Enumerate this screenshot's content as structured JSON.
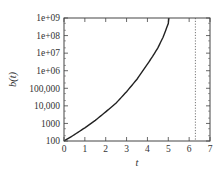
{
  "chart_data": {
    "type": "line",
    "title": "",
    "xlabel": "t",
    "ylabel": "b(t)",
    "xlim": [
      0,
      7
    ],
    "ylim": [
      100,
      1000000000
    ],
    "yscale": "log",
    "grid": false,
    "legend": "none",
    "x_ticks": [
      0,
      1,
      2,
      3,
      4,
      5,
      6,
      7
    ],
    "x_tick_labels": [
      "0",
      "1",
      "2",
      "3",
      "4",
      "5",
      "6",
      "7"
    ],
    "y_ticks": [
      100,
      1000,
      10000,
      100000,
      1000000,
      10000000,
      100000000,
      1000000000
    ],
    "y_tick_labels": [
      "100",
      "1000",
      "10,000",
      "100,000",
      "1e+06",
      "1e+07",
      "1e+08",
      "1e+09"
    ],
    "series": [
      {
        "name": "b(t)",
        "color": "#222222",
        "style": "solid",
        "x": [
          0,
          0.5,
          1,
          1.5,
          2,
          2.5,
          3,
          3.5,
          4,
          4.25,
          4.5,
          4.75,
          5.0,
          5.03
        ],
        "y": [
          100,
          229,
          564,
          1490,
          4550,
          14500,
          64000,
          328000,
          2380000,
          6540000,
          20000000,
          80000000,
          486000000,
          1000000000
        ]
      }
    ],
    "reference_lines": [
      {
        "orientation": "vertical",
        "x": 6.3,
        "style": "dotted",
        "color": "#555555"
      }
    ]
  }
}
